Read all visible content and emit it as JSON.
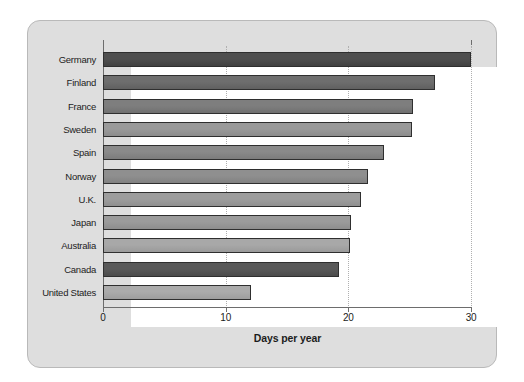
{
  "chart_data": {
    "type": "bar",
    "orientation": "horizontal",
    "title": "",
    "xlabel": "Days per year",
    "ylabel": "",
    "xlim": [
      0,
      30
    ],
    "xticks": [
      0,
      10,
      20,
      30
    ],
    "xtick_labels": [
      "0",
      "10",
      "20",
      "30"
    ],
    "grid": "vertical-dotted-at-10-20-30",
    "legend": "none",
    "categories": [
      "Germany",
      "Finland",
      "France",
      "Sweden",
      "Spain",
      "Norway",
      "U.K.",
      "Japan",
      "Australia",
      "Canada",
      "United States"
    ],
    "values": [
      30.0,
      27.1,
      25.3,
      25.2,
      22.9,
      21.6,
      21.0,
      20.2,
      20.1,
      19.2,
      12.1
    ],
    "bar_colors": [
      "#4f4f4f",
      "#6e6e6e",
      "#7e7e7e",
      "#9a9a9a",
      "#8a8a8a",
      "#8f8f8f",
      "#9d9d9d",
      "#9b9b9b",
      "#a8a8a8",
      "#595959",
      "#ababab"
    ]
  },
  "style": {
    "panel_color": "#dedede",
    "plot_color": "#ffffff",
    "axis_color": "#6d6d6d",
    "text_color": "#1c1c1c",
    "grid_color": "#b0b0b0"
  }
}
